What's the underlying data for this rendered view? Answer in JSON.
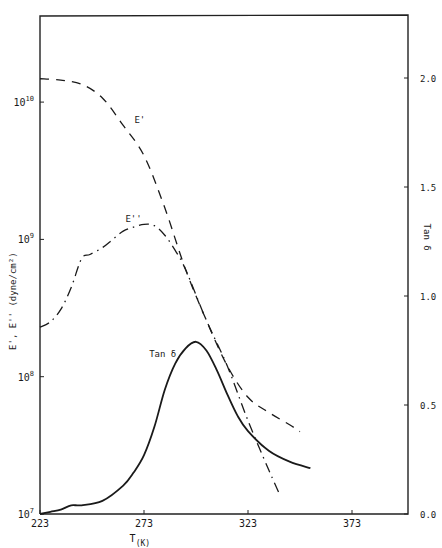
{
  "chart_data": {
    "type": "line",
    "title": "",
    "xlabel": "T(K)",
    "ylabel_left": "E', E'' (dyne/cm²)",
    "ylabel_right": "Tan δ",
    "xlim": [
      223,
      373
    ],
    "ylim_left_log10": [
      7,
      10.4
    ],
    "ylim_right": [
      0.0,
      2.2
    ],
    "x_ticks": [
      223,
      273,
      323,
      373
    ],
    "y_left_ticks": [
      {
        "exp": 7,
        "label": "10",
        "sup": "7"
      },
      {
        "exp": 8,
        "label": "10",
        "sup": "8"
      },
      {
        "exp": 9,
        "label": "10",
        "sup": "9"
      },
      {
        "exp": 10,
        "label": "10",
        "sup": "10"
      }
    ],
    "y_right_ticks": [
      "0.0",
      "0.5",
      "1.0",
      "1.5",
      "2.0"
    ],
    "y_right_tick_values": [
      0.0,
      0.5,
      1.0,
      1.5,
      2.0
    ],
    "grid": false,
    "series": [
      {
        "name": "E'",
        "axis": "left",
        "scale": "log10",
        "style": "dashed",
        "label_pos": [
          271,
          9.85
        ],
        "x": [
          223,
          233,
          243,
          253,
          263,
          273,
          283,
          293,
          303,
          313,
          323,
          333,
          343,
          348
        ],
        "log10_values": [
          10.17,
          10.16,
          10.13,
          10.03,
          9.83,
          9.61,
          9.23,
          8.78,
          8.41,
          8.08,
          7.85,
          7.74,
          7.65,
          7.6
        ]
      },
      {
        "name": "E''",
        "axis": "left",
        "scale": "log10",
        "style": "dashdot",
        "label_pos": [
          268,
          9.13
        ],
        "x": [
          223,
          228,
          233,
          238,
          243,
          247,
          253,
          258,
          263,
          268,
          273,
          278,
          283,
          288,
          293,
          303,
          313,
          323,
          333,
          338
        ],
        "log10_values": [
          8.36,
          8.4,
          8.49,
          8.65,
          8.86,
          8.89,
          8.94,
          9.0,
          9.06,
          9.09,
          9.11,
          9.1,
          9.03,
          8.92,
          8.78,
          8.41,
          8.08,
          7.68,
          7.32,
          7.15
        ]
      },
      {
        "name": "Tan δ",
        "axis": "right",
        "scale": "linear",
        "style": "solid",
        "label_pos": [
          282,
          0.72
        ],
        "x": [
          223,
          228,
          233,
          238,
          243,
          253,
          263,
          268,
          273,
          278,
          283,
          288,
          293,
          298,
          303,
          308,
          313,
          318,
          323,
          333,
          343,
          353
        ],
        "values": [
          0.0,
          0.01,
          0.02,
          0.04,
          0.04,
          0.06,
          0.13,
          0.19,
          0.27,
          0.4,
          0.57,
          0.69,
          0.76,
          0.79,
          0.75,
          0.66,
          0.55,
          0.45,
          0.38,
          0.29,
          0.24,
          0.21
        ]
      }
    ]
  }
}
